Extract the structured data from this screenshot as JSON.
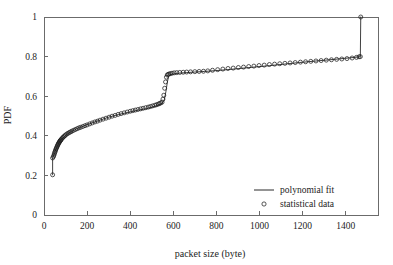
{
  "chart_data": {
    "type": "line",
    "title": "",
    "subtitle": "",
    "xlabel": "packet size (byte)",
    "ylabel": "PDF",
    "xlim": [
      0,
      1550
    ],
    "ylim": [
      0,
      1
    ],
    "xticks": [
      0,
      200,
      400,
      600,
      800,
      1000,
      1200,
      1400
    ],
    "yticks": [
      0,
      0.2,
      0.4,
      0.6,
      0.8,
      1
    ],
    "xtick_labels": [
      "0",
      "200",
      "400",
      "600",
      "800",
      "1000",
      "1200",
      "1400"
    ],
    "ytick_labels": [
      "0",
      "0.2",
      "0.4",
      "0.6",
      "0.8",
      "1"
    ],
    "grid": false,
    "legend_position": "lower-right",
    "legend": [
      {
        "label": "polynomial fit",
        "marker": "line"
      },
      {
        "label": "statistical data",
        "marker": "circle"
      }
    ],
    "series": [
      {
        "name": "statistical data",
        "marker": "circle",
        "x": [
          40,
          40,
          44,
          46,
          48,
          50,
          52,
          54,
          56,
          58,
          60,
          62,
          64,
          66,
          68,
          70,
          72,
          74,
          76,
          78,
          80,
          84,
          88,
          92,
          96,
          100,
          106,
          112,
          118,
          124,
          130,
          138,
          146,
          154,
          162,
          170,
          180,
          190,
          200,
          212,
          224,
          236,
          248,
          260,
          274,
          288,
          302,
          316,
          330,
          344,
          358,
          372,
          386,
          400,
          412,
          424,
          436,
          448,
          460,
          472,
          484,
          494,
          504,
          514,
          522,
          530,
          536,
          542,
          548,
          552,
          556,
          560,
          564,
          568,
          572,
          576,
          580,
          586,
          594,
          604,
          616,
          630,
          646,
          662,
          680,
          700,
          720,
          740,
          760,
          782,
          806,
          830,
          854,
          878,
          902,
          926,
          950,
          974,
          998,
          1022,
          1046,
          1070,
          1094,
          1118,
          1142,
          1166,
          1190,
          1214,
          1238,
          1262,
          1286,
          1310,
          1334,
          1358,
          1382,
          1406,
          1430,
          1450,
          1462,
          1468,
          1470
        ],
        "y": [
          0.203,
          0.288,
          0.295,
          0.302,
          0.309,
          0.316,
          0.322,
          0.328,
          0.334,
          0.339,
          0.344,
          0.349,
          0.354,
          0.358,
          0.362,
          0.366,
          0.37,
          0.373,
          0.376,
          0.379,
          0.382,
          0.387,
          0.392,
          0.396,
          0.4,
          0.404,
          0.409,
          0.413,
          0.417,
          0.42,
          0.424,
          0.428,
          0.432,
          0.436,
          0.44,
          0.443,
          0.447,
          0.451,
          0.455,
          0.46,
          0.465,
          0.47,
          0.474,
          0.479,
          0.484,
          0.489,
          0.494,
          0.499,
          0.503,
          0.508,
          0.512,
          0.516,
          0.52,
          0.524,
          0.527,
          0.53,
          0.533,
          0.536,
          0.539,
          0.542,
          0.545,
          0.548,
          0.551,
          0.554,
          0.557,
          0.56,
          0.563,
          0.566,
          0.57,
          0.585,
          0.605,
          0.64,
          0.672,
          0.696,
          0.707,
          0.71,
          0.712,
          0.714,
          0.716,
          0.718,
          0.719,
          0.72,
          0.721,
          0.722,
          0.723,
          0.724,
          0.725,
          0.726,
          0.728,
          0.731,
          0.734,
          0.737,
          0.74,
          0.742,
          0.745,
          0.747,
          0.75,
          0.752,
          0.755,
          0.757,
          0.76,
          0.762,
          0.764,
          0.766,
          0.768,
          0.77,
          0.772,
          0.774,
          0.776,
          0.778,
          0.78,
          0.782,
          0.784,
          0.786,
          0.788,
          0.79,
          0.793,
          0.796,
          0.799,
          0.8,
          1.0
        ]
      },
      {
        "name": "polynomial fit",
        "marker": "line",
        "x": [
          40,
          40,
          50,
          60,
          70,
          80,
          95,
          110,
          130,
          155,
          185,
          220,
          260,
          300,
          345,
          390,
          435,
          480,
          520,
          545,
          558,
          566,
          572,
          578,
          585,
          600,
          625,
          660,
          700,
          745,
          795,
          850,
          910,
          975,
          1045,
          1115,
          1185,
          1255,
          1325,
          1395,
          1450,
          1468,
          1470
        ],
        "y": [
          0.203,
          0.288,
          0.316,
          0.344,
          0.366,
          0.382,
          0.395,
          0.411,
          0.424,
          0.437,
          0.45,
          0.464,
          0.479,
          0.494,
          0.507,
          0.518,
          0.529,
          0.538,
          0.551,
          0.561,
          0.58,
          0.625,
          0.668,
          0.7,
          0.709,
          0.712,
          0.716,
          0.719,
          0.722,
          0.725,
          0.729,
          0.734,
          0.74,
          0.747,
          0.754,
          0.762,
          0.77,
          0.777,
          0.784,
          0.791,
          0.797,
          0.8,
          1.0
        ]
      }
    ]
  },
  "figure": {
    "caption_fragment": ""
  }
}
